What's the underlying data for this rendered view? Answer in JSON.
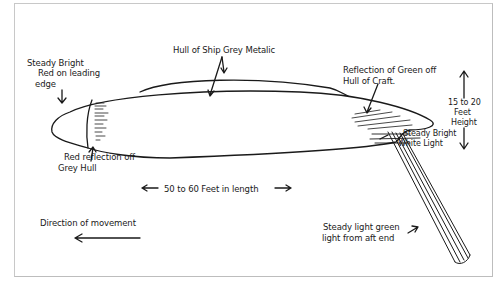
{
  "diagram": {
    "type": "hand-drawn sketch",
    "colors": {
      "ink": "#1a1a1a",
      "paper": "#ffffff",
      "frame": "#c8c8c8"
    }
  },
  "labels": {
    "red_leading_edge": [
      "Steady Bright",
      "Red on leading",
      "edge"
    ],
    "hull_metalic": "Hull of Ship Grey Metalic",
    "green_reflection": [
      "Reflection of Green off",
      "Hull of Craft."
    ],
    "height": [
      "15 to 20",
      "Feet",
      "Height"
    ],
    "white_light": [
      "Steady Bright",
      "White Light"
    ],
    "red_reflection": [
      "Red reflection off",
      "Grey Hull"
    ],
    "length": "50 to 60 Feet in length",
    "direction": "Direction of movement",
    "green_light": [
      "Steady light green",
      "light from aft end"
    ]
  },
  "icons": {
    "arrow_left": "←",
    "arrow_right": "→",
    "arrow_up": "↑",
    "arrow_down": "↓"
  }
}
